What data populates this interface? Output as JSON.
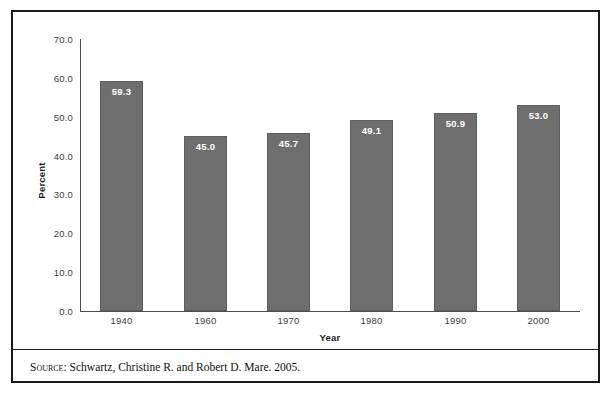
{
  "chart_data": {
    "type": "bar",
    "title": "",
    "subtitle": "",
    "xlabel": "Year",
    "ylabel": "Percent",
    "categories": [
      "1940",
      "1960",
      "1970",
      "1980",
      "1990",
      "2000"
    ],
    "values": [
      59.3,
      45.0,
      45.7,
      49.1,
      50.9,
      53.0
    ],
    "value_labels": [
      "59.3",
      "45.0",
      "45.7",
      "49.1",
      "50.9",
      "53.0"
    ],
    "ylim": [
      0.0,
      70.0
    ],
    "ytick_labels": [
      "70.0",
      "60.0",
      "50.0",
      "40.0",
      "30.0",
      "20.0",
      "10.0",
      "0.0"
    ],
    "ytick_values": [
      70.0,
      60.0,
      50.0,
      40.0,
      30.0,
      20.0,
      10.0,
      0.0
    ],
    "grid": false,
    "legend": false,
    "legend_position": "none",
    "bar_color": "#6e6e6e",
    "bar_border_color": "#5e5e5e",
    "value_label_color": "#ffffff",
    "axis_color": "#4d4d4d"
  },
  "figure": {
    "border_color": "#1a1a1a",
    "background": "#ffffff"
  },
  "source": {
    "label": "Source:",
    "text": " Schwartz, Christine R. and Robert D. Mare. 2005."
  }
}
